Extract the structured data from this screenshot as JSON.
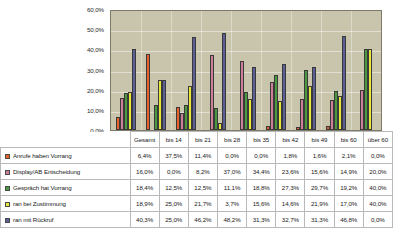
{
  "chart_data": {
    "type": "bar",
    "title": "",
    "xlabel": "",
    "ylabel": "",
    "ylim": [
      0,
      60
    ],
    "grid": true,
    "legend_position": "table-left",
    "ytick_labels": [
      "60,0%",
      "50,0%",
      "40,0%",
      "30,0%",
      "20,0%",
      "10,0%",
      "0,0%"
    ],
    "ytick_values": [
      60,
      50,
      40,
      30,
      20,
      10,
      0
    ],
    "categories": [
      "Gesamt",
      "bis 14",
      "bis 21",
      "bis 28",
      "bis 35",
      "bis 42",
      "bis 49",
      "bis 60",
      "über 60"
    ],
    "series": [
      {
        "name": "Anrufe haben Vorrang",
        "color": "#e8622a",
        "values": [
          6.4,
          37.5,
          11.4,
          0.0,
          0.0,
          1.8,
          1.6,
          2.1,
          0.0
        ],
        "labels": [
          "6,4%",
          "37,5%",
          "11,4%",
          "0,0%",
          "0,0%",
          "1,8%",
          "1,6%",
          "2,1%",
          "0,0%"
        ]
      },
      {
        "name": "Display/AB Entscheidung",
        "color": "#cc7f96",
        "values": [
          16.0,
          0.0,
          8.2,
          37.0,
          34.4,
          23.6,
          15.6,
          14.9,
          20.0
        ],
        "labels": [
          "16,0%",
          "0,0%",
          "8,2%",
          "37,0%",
          "34,4%",
          "23,6%",
          "15,6%",
          "14,9%",
          "20,0%"
        ]
      },
      {
        "name": "Gespräch hat Vorrang",
        "color": "#4c9a3f",
        "values": [
          18.4,
          12.5,
          12.5,
          11.1,
          18.8,
          27.3,
          29.7,
          19.2,
          40.0
        ],
        "labels": [
          "18,4%",
          "12,5%",
          "12,5%",
          "11,1%",
          "18,8%",
          "27,3%",
          "29,7%",
          "19,2%",
          "40,0%"
        ]
      },
      {
        "name": "ran bei Zustimmung",
        "color": "#e8e83c",
        "values": [
          18.9,
          25.0,
          21.7,
          3.7,
          15.6,
          14.6,
          21.9,
          17.0,
          40.0
        ],
        "labels": [
          "18,9%",
          "25,0%",
          "21,7%",
          "3,7%",
          "15,6%",
          "14,6%",
          "21,9%",
          "17,0%",
          "40,0%"
        ]
      },
      {
        "name": "ran mit Rückruf",
        "color": "#5b5f96",
        "values": [
          40.3,
          25.0,
          46.2,
          48.2,
          31.3,
          32.7,
          31.3,
          46.8,
          0.0
        ],
        "labels": [
          "40,3%",
          "25,0%",
          "46,2%",
          "48,2%",
          "31,3%",
          "32,7%",
          "31,3%",
          "46,8%",
          "0,0%"
        ]
      }
    ]
  },
  "plot": {
    "background_color": "#c9c5ad",
    "border_color": "#7d7a68"
  }
}
